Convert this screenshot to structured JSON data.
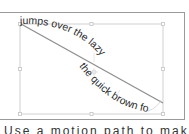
{
  "canvas": {
    "background": "#ffffff",
    "frame_color": "#9a9a9a",
    "selection_color": "#c8c8c8",
    "path_color": "#8f8f8f",
    "text_color": "#2a2a2a"
  },
  "text_on_path": {
    "upper_text": "jumps over the lazy",
    "lower_text": "the quick brown fox"
  },
  "selection": {
    "handles": [
      "top-left",
      "top-center",
      "top-right",
      "middle-left",
      "center",
      "middle-right",
      "bottom-left",
      "bottom-center",
      "bottom-right"
    ]
  },
  "caption": {
    "text": "Use a motion path to make the text"
  }
}
